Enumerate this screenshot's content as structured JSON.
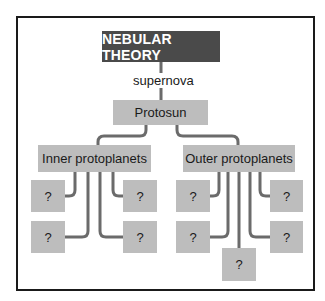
{
  "diagram": {
    "title": "NEBULAR THEORY",
    "edge_label": "supernova",
    "root_child": "Protosun",
    "branches": [
      {
        "label": "Inner protoplanets",
        "children": [
          "?",
          "?",
          "?",
          "?"
        ]
      },
      {
        "label": "Outer protoplanets",
        "children": [
          "?",
          "?",
          "?",
          "?",
          "?"
        ]
      }
    ]
  },
  "colors": {
    "title_bg": "#4a4a4a",
    "node_bg": "#bdbdbd",
    "connector": "#6b6b6b",
    "frame": "#1a1a1a"
  }
}
